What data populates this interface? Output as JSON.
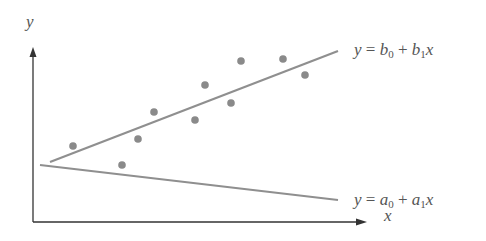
{
  "chart_data": {
    "type": "scatter",
    "title": "",
    "xlabel": "x",
    "ylabel": "y",
    "grid": false,
    "points_px": [
      [
        73,
        146
      ],
      [
        122,
        165
      ],
      [
        138,
        139
      ],
      [
        154,
        112
      ],
      [
        195,
        120
      ],
      [
        205,
        85
      ],
      [
        231,
        103
      ],
      [
        241,
        61
      ],
      [
        283,
        59
      ],
      [
        305,
        75
      ]
    ],
    "lines": [
      {
        "name": "fitted",
        "label": {
          "y": "y",
          "eq": "=",
          "c0": "b",
          "s0": "0",
          "plus": "+",
          "c1": "b",
          "s1": "1",
          "x": "x"
        },
        "from_px": [
          50,
          162
        ],
        "to_px": [
          338,
          51
        ]
      },
      {
        "name": "alternative",
        "label": {
          "y": "y",
          "eq": "=",
          "c0": "a",
          "s0": "0",
          "plus": "+",
          "c1": "a",
          "s1": "1",
          "x": "x"
        },
        "from_px": [
          40,
          165
        ],
        "to_px": [
          338,
          200
        ]
      }
    ]
  },
  "axes": {
    "x_label": "x",
    "y_label": "y"
  },
  "colors": {
    "axis": "#333333",
    "point": "#8a8a8a",
    "line": "#8f8f8f",
    "text": "#555555"
  }
}
